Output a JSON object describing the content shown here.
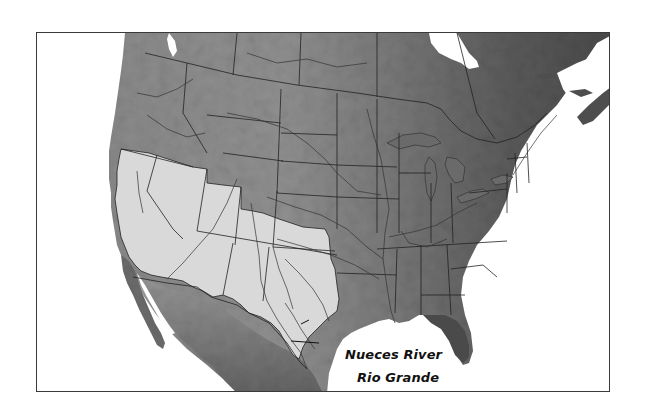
{
  "map": {
    "title": "",
    "style": "grayscale shaded relief",
    "region": "North America (United States, southern Canada, northern Mexico)",
    "highlighted_region": {
      "description": "Western / southwestern United States drainage area (California, Nevada, Utah, Arizona, New Mexico, Colorado, Texas, Oklahoma panhandle, southern Idaho/Oregon)",
      "fill_color": "#d9d9d9"
    },
    "colors": {
      "ocean": "#ffffff",
      "land_dark": "#4a4a4a",
      "land_mid": "#7a7a7a",
      "land_light": "#a8a8a8",
      "border_lines": "#222222",
      "rivers": "#333333",
      "frame": "#3a3a3a"
    },
    "labels": [
      {
        "id": "nueces-river",
        "text": "Nueces River"
      },
      {
        "id": "rio-grande",
        "text": "Rio Grande"
      }
    ]
  }
}
